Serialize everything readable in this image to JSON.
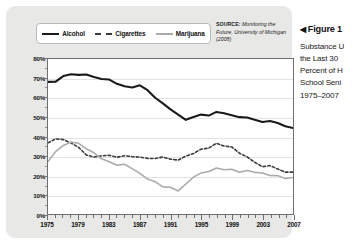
{
  "figure": {
    "caption_arrow": "◀",
    "caption_title": "Figure 1",
    "caption_lines": [
      "Substance U",
      "the Last 30 ",
      "Percent of H",
      "School Seni",
      "1975–2007"
    ]
  },
  "source": {
    "key": "SOURCE:",
    "text": " Monitoring the Future, University of Michigan (2008)"
  },
  "legend": [
    {
      "label": "Alcohol",
      "swatch": "solid-dark-line-icon",
      "color": "#1a1a1a"
    },
    {
      "label": "Cigarettes",
      "swatch": "dashed-line-icon",
      "color": "#3a3a3a"
    },
    {
      "label": "Marijuana",
      "swatch": "solid-gray-line-icon",
      "color": "#aaaaaa"
    }
  ],
  "chart_data": {
    "type": "line",
    "title": "",
    "xlabel": "",
    "ylabel": "",
    "xlim": [
      1975,
      2007
    ],
    "ylim": [
      0,
      80
    ],
    "ytick_labels": [
      "80%",
      "70%",
      "60%",
      "50%",
      "40%",
      "30%",
      "20%",
      "10%",
      "0%"
    ],
    "ytick_values": [
      80,
      70,
      60,
      50,
      40,
      30,
      20,
      10,
      0
    ],
    "xtick_labels": [
      "1975",
      "1979",
      "1983",
      "1987",
      "1991",
      "1995",
      "1999",
      "2003",
      "2007"
    ],
    "xtick_values": [
      1975,
      1979,
      1983,
      1987,
      1991,
      1995,
      1999,
      2003,
      2007
    ],
    "grid": true,
    "legend_position": "top-left",
    "x": [
      1975,
      1976,
      1977,
      1978,
      1979,
      1980,
      1981,
      1982,
      1983,
      1984,
      1985,
      1986,
      1987,
      1988,
      1989,
      1990,
      1991,
      1992,
      1993,
      1994,
      1995,
      1996,
      1997,
      1998,
      1999,
      2000,
      2001,
      2002,
      2003,
      2004,
      2005,
      2006,
      2007
    ],
    "series": [
      {
        "name": "Alcohol",
        "style": "solid",
        "color": "#1a1a1a",
        "width": 2.1,
        "values": [
          68.2,
          68.3,
          71.2,
          72.1,
          71.8,
          72.0,
          70.7,
          69.7,
          69.4,
          67.2,
          65.9,
          65.3,
          66.4,
          63.9,
          60.0,
          57.1,
          54.0,
          51.3,
          48.6,
          50.1,
          51.3,
          50.8,
          52.7,
          52.0,
          51.0,
          50.0,
          49.8,
          48.6,
          47.5,
          48.0,
          47.0,
          45.3,
          44.4
        ]
      },
      {
        "name": "Cigarettes",
        "style": "dashed",
        "color": "#3a3a3a",
        "width": 1.6,
        "values": [
          36.7,
          38.8,
          38.4,
          36.7,
          34.4,
          30.5,
          29.4,
          30.0,
          30.3,
          29.3,
          30.1,
          29.6,
          29.4,
          28.7,
          28.6,
          29.4,
          28.3,
          27.8,
          29.9,
          31.2,
          33.5,
          34.0,
          36.5,
          35.1,
          34.6,
          31.4,
          29.5,
          26.7,
          24.4,
          25.0,
          23.2,
          21.6,
          21.6
        ]
      },
      {
        "name": "Marijuana",
        "style": "solid",
        "color": "#aaaaaa",
        "width": 1.6,
        "values": [
          27.1,
          32.2,
          35.4,
          37.1,
          36.5,
          33.7,
          31.6,
          28.5,
          27.0,
          25.2,
          25.7,
          23.4,
          21.0,
          18.0,
          16.7,
          14.0,
          13.8,
          11.9,
          15.5,
          19.0,
          21.2,
          21.9,
          23.7,
          22.8,
          23.1,
          21.6,
          22.4,
          21.5,
          21.2,
          19.9,
          19.8,
          18.3,
          18.8
        ]
      }
    ]
  }
}
